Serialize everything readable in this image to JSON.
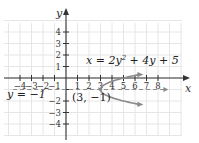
{
  "chart_data": {
    "type": "line",
    "title": "",
    "equation": "x = 2y² + 4y + 5",
    "equation_parts": {
      "lhs": "x = 2y",
      "exp": "2",
      "rhs": " + 4y + 5"
    },
    "xlabel": "x",
    "ylabel": "y",
    "xlim": [
      -5,
      10
    ],
    "ylim": [
      -5,
      5
    ],
    "x_ticks": [
      -4,
      -3,
      -2,
      -1,
      1,
      2,
      3,
      4,
      5,
      6,
      7,
      8
    ],
    "x_tick_labels": [
      "−4",
      "−3",
      "−2",
      "−1",
      "1",
      "2",
      "3",
      "4",
      "5",
      "6",
      "7",
      "8"
    ],
    "y_ticks": [
      -4,
      -3,
      -2,
      1,
      2,
      3,
      4
    ],
    "y_tick_labels": [
      "−4",
      "−3",
      "−2",
      "1",
      "2",
      "3",
      "4"
    ],
    "y_tick_minus1_label": "1",
    "grid": true,
    "legend": null,
    "series": [
      {
        "name": "x = 2y² + 4y + 5",
        "style": "solid",
        "color": "#8a8a8a",
        "points": [
          {
            "y": 0.3,
            "x": 8.4
          },
          {
            "y": 0.0,
            "x": 5
          },
          {
            "y": -0.5,
            "x": 3.5
          },
          {
            "y": -1,
            "x": 3
          },
          {
            "y": -1.5,
            "x": 3.5
          },
          {
            "y": -2,
            "x": 5
          },
          {
            "y": -2.3,
            "x": 8.4
          }
        ]
      },
      {
        "name": "y = −1",
        "style": "dashed",
        "color": "#8a8a8a",
        "points": [
          {
            "x": -4.6,
            "y": -1
          },
          {
            "x": 8.9,
            "y": -1
          }
        ]
      }
    ],
    "annotations": [
      {
        "text": "x = 2y² + 4y + 5",
        "near": {
          "x": 3.4,
          "y": 1.3
        }
      },
      {
        "text": "y = −1",
        "near": {
          "x": -5,
          "y": -1.4
        }
      },
      {
        "text": "(3, −1)",
        "near": {
          "x": 0.8,
          "y": -1.8
        },
        "marks": "vertex"
      }
    ]
  },
  "labels": {
    "axis_x": "x",
    "axis_y": "y",
    "axis_symmetry": "y = −1",
    "vertex": "(3, −1)"
  },
  "colors": {
    "axis": "#333333",
    "curve": "#8a8a8a",
    "grid": "#e6e6e6",
    "text": "#222222"
  }
}
